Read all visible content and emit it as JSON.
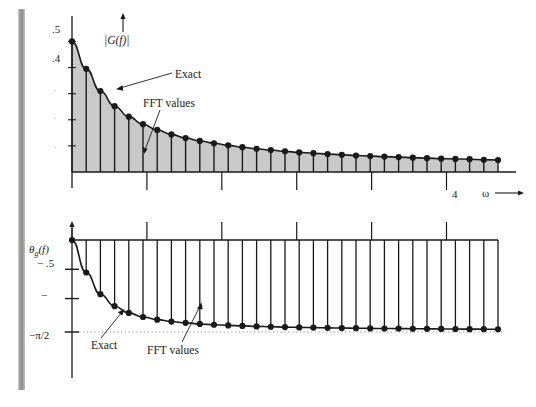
{
  "figure": {
    "kind": "two-panel-spectrum-figure",
    "background": "#ffffff",
    "ink": "#1a1a1a",
    "fill": "#c9c9c9",
    "page_edge_color": "#9a9a9a"
  },
  "chart_data": [
    {
      "type": "bar",
      "panel": "magnitude",
      "title": "",
      "ylabel": "|G(f)|",
      "xlabel": "ω",
      "xlabel_arrow": "→",
      "yaxis_arrow": "↑",
      "grid": false,
      "legend": [
        "Exact",
        "FFT values"
      ],
      "legend_position": "in-plot annotations with leader lines",
      "ytick_labels": [
        ".5",
        ".4",
        ".",
        ".",
        "."
      ],
      "ytick_values": [
        0.5,
        0.4,
        0.3,
        0.2,
        0.1
      ],
      "ytick_note": "labels for .3 .2 .1 are faded to dots in the scan",
      "ylim": [
        0,
        0.54
      ],
      "xlim": [
        0,
        4.55
      ],
      "xtick_labels": [
        "",
        "",
        "",
        "",
        "4"
      ],
      "xtick_values": [
        0.8,
        1.6,
        2.4,
        3.2,
        4.0
      ],
      "categories": [
        0,
        1,
        2,
        3,
        4,
        5,
        6,
        7,
        8,
        9,
        10,
        11,
        12,
        13,
        14,
        15,
        16,
        17,
        18,
        19,
        20,
        21,
        22,
        23,
        24,
        25,
        26,
        27,
        28,
        29,
        30
      ],
      "values": [
        0.5,
        0.395,
        0.31,
        0.252,
        0.212,
        0.183,
        0.161,
        0.144,
        0.13,
        0.119,
        0.11,
        0.102,
        0.095,
        0.089,
        0.084,
        0.079,
        0.075,
        0.072,
        0.069,
        0.066,
        0.063,
        0.061,
        0.059,
        0.057,
        0.055,
        0.053,
        0.051,
        0.05,
        0.049,
        0.047,
        0.046
      ],
      "exact_curve": "smooth decaying envelope through the FFT sample tops",
      "annotations": [
        {
          "text": "Exact",
          "points_to": "exact envelope curve"
        },
        {
          "text": "FFT values",
          "points_to": "a sample dot on the curve"
        }
      ]
    },
    {
      "type": "bar",
      "panel": "phase",
      "title": "",
      "ylabel": "θg(f)",
      "ylabel_parts": {
        "theta": "θ",
        "sub": "g",
        "arg": "(f)"
      },
      "xlabel": "",
      "yaxis_arrow": "↑",
      "grid": false,
      "legend": [
        "Exact",
        "FFT values"
      ],
      "legend_position": "in-plot annotations with leader lines",
      "ytick_labels": [
        "− .5",
        "−",
        "−π/2"
      ],
      "ytick_values": [
        -0.5,
        -1.0,
        -1.5708
      ],
      "ylim": [
        -1.72,
        0.06
      ],
      "xlim": [
        0,
        4.55
      ],
      "asymptote": {
        "value": -1.5708,
        "label": "−π/2",
        "style": "dotted"
      },
      "categories": [
        0,
        1,
        2,
        3,
        4,
        5,
        6,
        7,
        8,
        9,
        10,
        11,
        12,
        13,
        14,
        15,
        16,
        17,
        18,
        19,
        20,
        21,
        22,
        23,
        24,
        25,
        26,
        27,
        28,
        29,
        30
      ],
      "values": [
        0.0,
        -0.555,
        -0.925,
        -1.13,
        -1.245,
        -1.315,
        -1.36,
        -1.392,
        -1.415,
        -1.433,
        -1.447,
        -1.458,
        -1.467,
        -1.475,
        -1.481,
        -1.487,
        -1.492,
        -1.496,
        -1.5,
        -1.503,
        -1.506,
        -1.509,
        -1.511,
        -1.513,
        -1.515,
        -1.517,
        -1.519,
        -1.52,
        -1.522,
        -1.523,
        -1.524
      ],
      "exact_curve": "smooth curve approaching −π/2",
      "annotations": [
        {
          "text": "Exact",
          "points_to": "exact phase curve"
        },
        {
          "text": "FFT values",
          "points_to": "a phase sample dot"
        }
      ]
    }
  ],
  "top_panel": {
    "yaxis_label": "|G(f)|",
    "yaxis_label_plain": "|G(f)|",
    "arrow_up": "↑",
    "tick_05": ".5",
    "tick_04": ".4",
    "tick_03": ".",
    "tick_02": ".",
    "tick_01": ".",
    "ann_exact": "Exact",
    "ann_fft": "FFT values",
    "xtick_4": "4",
    "omega": "ω",
    "omega_arrow": "→"
  },
  "bottom_panel": {
    "yaxis_label_theta": "θ",
    "yaxis_label_sub": "g",
    "yaxis_label_arg": "(f)",
    "arrow_up": "↑",
    "tick_half": "− .5",
    "tick_one": "−",
    "tick_pi2": "−π/2",
    "ann_exact": "Exact",
    "ann_fft": "FFT values"
  }
}
